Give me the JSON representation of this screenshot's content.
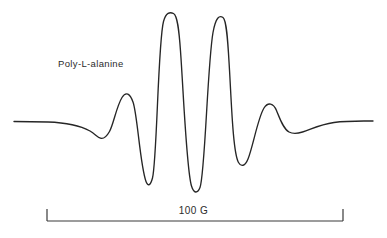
{
  "figure": {
    "sample_label": "Poly-L-alanine",
    "scale_bar_label": "100 G",
    "background_color": "#ffffff",
    "trace_color": "#262626",
    "axis_color": "#3a3a3a",
    "text_color": "#2b2b2b"
  },
  "chart_data": {
    "type": "line",
    "title": "Poly-L-alanine",
    "subtitle": "",
    "xlabel": "",
    "ylabel": "",
    "annotations": [
      {
        "name": "sample-label",
        "text": "Poly-L-alanine",
        "x_px": 58,
        "y_px": 58
      },
      {
        "name": "scale-bar-label",
        "text": "100 G",
        "x_px": 193,
        "y_px": 212
      }
    ],
    "scale_bar": {
      "label": "100 G",
      "value": 100,
      "unit": "G",
      "x_start_px": 47,
      "x_end_px": 343,
      "baseline_y_px": 221,
      "tick_height_px": 12
    },
    "grid": false,
    "legend": null,
    "axis_ranges": {
      "xlim_px": [
        14,
        373
      ],
      "ylim_px": [
        13,
        192
      ]
    },
    "baseline_y_px": 121,
    "features": [
      {
        "name": "left-baseline-start",
        "x_px": 14,
        "y_px": 121,
        "kind": "baseline"
      },
      {
        "name": "left-shallow-trough",
        "x_px": 100,
        "y_px": 138,
        "kind": "minimum"
      },
      {
        "name": "first-side-peak",
        "x_px": 122,
        "y_px": 97,
        "kind": "maximum"
      },
      {
        "name": "left-deep-valley",
        "x_px": 147,
        "y_px": 184,
        "kind": "minimum"
      },
      {
        "name": "first-central-peak",
        "x_px": 172,
        "y_px": 13,
        "kind": "maximum"
      },
      {
        "name": "central-deep-valley",
        "x_px": 197,
        "y_px": 192,
        "kind": "minimum"
      },
      {
        "name": "second-central-peak",
        "x_px": 223,
        "y_px": 17,
        "kind": "maximum"
      },
      {
        "name": "right-deep-valley",
        "x_px": 244,
        "y_px": 164,
        "kind": "minimum"
      },
      {
        "name": "right-side-peak",
        "x_px": 271,
        "y_px": 105,
        "kind": "maximum"
      },
      {
        "name": "right-shallow-trough",
        "x_px": 300,
        "y_px": 133,
        "kind": "minimum"
      },
      {
        "name": "right-baseline-end",
        "x_px": 373,
        "y_px": 121,
        "kind": "baseline"
      }
    ],
    "path_d": "M 14,121.5 L 48,122.0 C 66,122.6 80,125.5 90,131.0 C 95.5,134.4 97.5,137.3 100.5,138.2 C 104,139.2 106.5,136.8 109.5,131.5 C 113.5,124.2 116.5,106.5 122.0,97.5 C 126.0,91.0 130.0,93.5 133.0,102.0 C 137.5,114.5 140.0,165.0 146.0,181.5 C 148.0,187.0 150.5,185.5 152.5,178.0 C 157.0,160.5 158.0,42.0 163.5,21.5 C 166.0,12.2 170.0,11.8 173.5,13.5 C 177.5,15.5 179.0,30.0 180.5,51.0 C 183.5,92.5 186.5,170.0 191.5,186.0 C 193.8,193.6 197.5,193.8 200.0,187.5 C 205.0,175.0 207.5,63.5 213.0,32.5 C 215.8,17.0 219.5,15.0 223.0,17.5 C 227.0,20.4 228.0,45.0 229.5,70.0 C 231.5,104.0 233.0,152.5 238.5,162.5 C 241.0,167.0 245.0,166.5 248.0,159.0 C 253.0,146.5 258.0,117.5 264.0,108.0 C 268.0,101.7 273.5,103.0 276.5,110.5 C 280.0,119.2 283.5,129.0 289.0,132.0 C 293.5,134.4 297.0,133.8 302.5,132.0 C 312.0,128.9 320.0,124.5 334.0,122.5 C 348.0,120.5 362.0,121.0 373,121.0"
  }
}
